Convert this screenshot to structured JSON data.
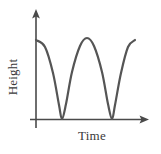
{
  "figure": {
    "background_color": "#ffffff",
    "width": 161,
    "height": 154
  },
  "axes": {
    "stroke_color": "#4a4a4a",
    "stroke_width": 1.6,
    "y_axis": {
      "x": 36,
      "y_top": 12,
      "y_bottom": 128,
      "arrow": "up-arrow"
    },
    "x_axis": {
      "y": 119,
      "x_left": 30,
      "x_right": 145,
      "arrow": "right-arrow"
    },
    "ylabel": "Height",
    "xlabel": "Time"
  },
  "chart_data": {
    "type": "line",
    "title": "",
    "xlabel": "Time",
    "ylabel": "Height",
    "grid": false,
    "legend": null,
    "x_tick_labels": [],
    "y_tick_labels": [],
    "axis_arrows": true,
    "series": [
      {
        "name": "Height over time",
        "description": "Periodic wave: two full cycles starting at a crest, touching zero height at each trough",
        "color": "#555555",
        "stroke_width": 2.2,
        "points_px": [
          [
            36,
            40
          ],
          [
            45,
            47
          ],
          [
            53,
            73
          ],
          [
            59,
            105
          ],
          [
            62,
            119
          ],
          [
            66,
            104
          ],
          [
            72,
            72
          ],
          [
            80,
            46
          ],
          [
            87,
            38
          ],
          [
            94,
            46
          ],
          [
            102,
            72
          ],
          [
            108,
            104
          ],
          [
            112,
            119
          ],
          [
            115,
            105
          ],
          [
            121,
            73
          ],
          [
            128,
            47
          ],
          [
            135,
            40
          ]
        ],
        "crest_x_px": [
          36,
          87,
          135
        ],
        "trough_x_px": [
          62,
          112
        ],
        "baseline_y_px": 119,
        "crest_y_px": 38
      }
    ]
  }
}
